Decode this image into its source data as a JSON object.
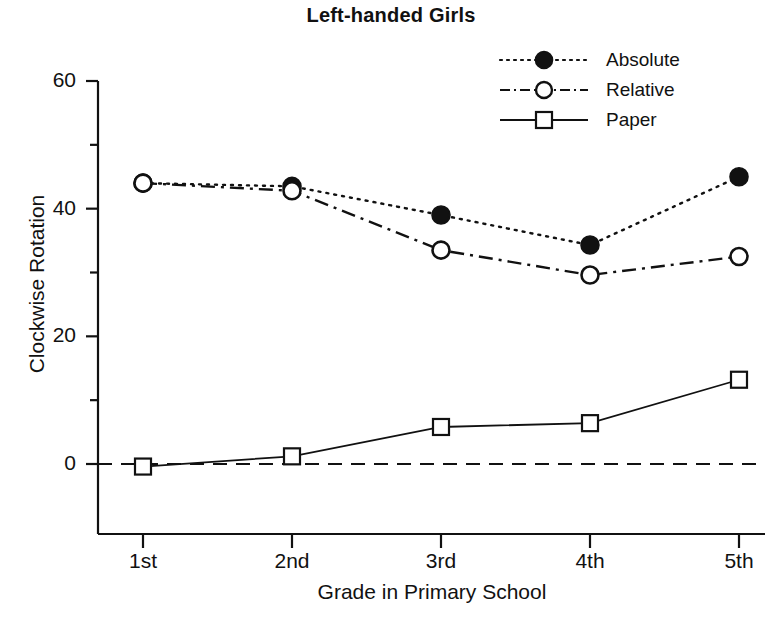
{
  "chart_data": {
    "type": "line",
    "title": "Left-handed Girls",
    "xlabel": "Grade in Primary School",
    "ylabel": "Clockwise Rotation",
    "categories": [
      "1st",
      "2nd",
      "3rd",
      "4th",
      "5th"
    ],
    "x_tick_labels": [
      "1st",
      "2nd",
      "3rd",
      "4th",
      "5th"
    ],
    "y_tick_labels": [
      "0",
      "20",
      "40",
      "60"
    ],
    "y_major_ticks": [
      0,
      20,
      40,
      60
    ],
    "y_minor_ticks": [
      10,
      30,
      50
    ],
    "ylim": [
      -12,
      62
    ],
    "grid": false,
    "legend_position": "top-right",
    "reference_line": {
      "y": 0,
      "style": "dashed"
    },
    "series": [
      {
        "name": "Absolute",
        "marker": "filled-circle",
        "line_style": "dotted",
        "values": [
          44.0,
          43.5,
          39.0,
          34.3,
          45.0
        ]
      },
      {
        "name": "Relative",
        "marker": "open-circle",
        "line_style": "dash-dot",
        "values": [
          44.0,
          42.8,
          33.5,
          29.6,
          32.5
        ]
      },
      {
        "name": "Paper",
        "marker": "open-square",
        "line_style": "solid",
        "values": [
          -0.4,
          1.2,
          5.8,
          6.4,
          13.2
        ]
      }
    ]
  },
  "legend": {
    "items": [
      {
        "label": "Absolute"
      },
      {
        "label": "Relative"
      },
      {
        "label": "Paper"
      }
    ]
  },
  "axes": {
    "y_labels": [
      "60",
      "40",
      "20",
      "0"
    ],
    "x_labels": [
      "1st",
      "2nd",
      "3rd",
      "4th",
      "5th"
    ]
  },
  "colors": {
    "ink": "#111111",
    "background": "#ffffff"
  }
}
